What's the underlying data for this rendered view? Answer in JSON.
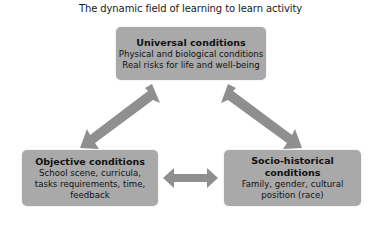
{
  "title": "The dynamic field of learning to learn activity",
  "colors": {
    "box_fill": "#a9a9a9",
    "arrow_fill": "#8f8f8f",
    "text": "#111111",
    "background": "#ffffff"
  },
  "nodes": {
    "universal": {
      "heading": "Universal conditions",
      "lines": [
        "Physical and biological conditions",
        "Real risks for life and well-being"
      ]
    },
    "objective": {
      "heading": "Objective conditions",
      "lines": [
        "School scene, curricula,",
        "tasks requirements, time,",
        "feedback"
      ]
    },
    "socio_historical": {
      "heading": "Socio-historical conditions",
      "lines": [
        "Family, gender, cultural",
        "position (race)"
      ]
    }
  },
  "edges": [
    {
      "from": "universal",
      "to": "objective",
      "type": "bidirectional"
    },
    {
      "from": "universal",
      "to": "socio_historical",
      "type": "bidirectional"
    },
    {
      "from": "objective",
      "to": "socio_historical",
      "type": "bidirectional"
    }
  ]
}
